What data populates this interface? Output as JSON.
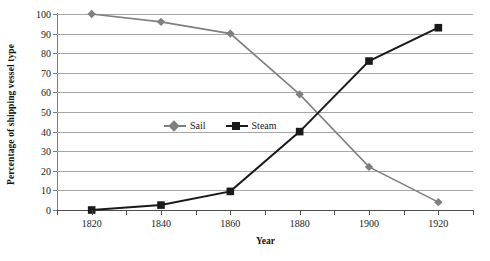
{
  "chart_data": {
    "type": "line",
    "title": "",
    "xlabel": "Year",
    "ylabel": "Percentage of shipping vessel type",
    "categories": [
      1820,
      1840,
      1860,
      1880,
      1900,
      1920
    ],
    "x_tick_labels": [
      "1820",
      "1840",
      "1860",
      "1880",
      "1900",
      "1920"
    ],
    "y_tick_labels": [
      "0",
      "10",
      "20",
      "30",
      "40",
      "50",
      "60",
      "70",
      "80",
      "90",
      "100"
    ],
    "y_ticks": [
      0,
      10,
      20,
      30,
      40,
      50,
      60,
      70,
      80,
      90,
      100
    ],
    "ylim": [
      0,
      100
    ],
    "xlim": [
      1810,
      1930
    ],
    "grid": "horizontal",
    "legend_position": "inside-center",
    "series": [
      {
        "name": "Sail",
        "color": "#7f7f7f",
        "marker": "diamond",
        "values": [
          100,
          96,
          90,
          59,
          22,
          4
        ]
      },
      {
        "name": "Steam",
        "color": "#1a1a1a",
        "marker": "square",
        "values": [
          0,
          2.5,
          9.5,
          40,
          76,
          93
        ]
      }
    ]
  },
  "legend": {
    "entries": [
      {
        "label": "Sail"
      },
      {
        "label": "Steam"
      }
    ]
  },
  "colors": {
    "sail": "#7f7f7f",
    "steam": "#1a1a1a",
    "gridline": "#a6a6a6",
    "axis": "#4d4d4d",
    "background": "#ffffff"
  }
}
